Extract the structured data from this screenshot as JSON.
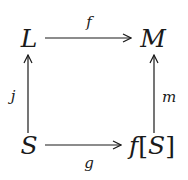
{
  "diagram": {
    "type": "commutative-square",
    "nodes": {
      "top_left": "L",
      "top_right": "M",
      "bottom_left": "S",
      "bottom_right": {
        "func": "f",
        "open": "[",
        "arg": "S",
        "close": "]"
      }
    },
    "arrows": [
      {
        "from": "L",
        "to": "M",
        "label": "f",
        "direction": "right",
        "label_position": "above"
      },
      {
        "from": "S",
        "to": "L",
        "label": "j",
        "direction": "up",
        "label_position": "left"
      },
      {
        "from": "f[S]",
        "to": "M",
        "label": "m",
        "direction": "up",
        "label_position": "right"
      },
      {
        "from": "S",
        "to": "f[S]",
        "label": "g",
        "direction": "right",
        "label_position": "below"
      }
    ],
    "labels": {
      "f": "f",
      "j": "j",
      "m": "m",
      "g": "g"
    },
    "stroke_color": "#1a1a1a"
  }
}
